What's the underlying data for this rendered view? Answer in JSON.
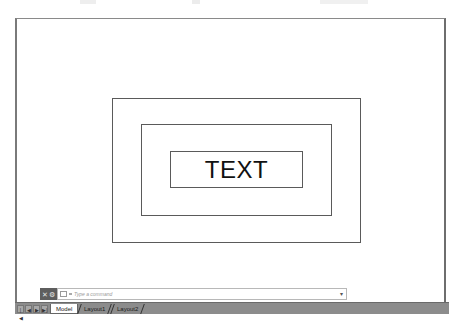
{
  "drawing": {
    "text_label": "TEXT",
    "rectangles": [
      {
        "name": "outer",
        "x": 110,
        "y": 97,
        "w": 249,
        "h": 145
      },
      {
        "name": "inner",
        "x": 139,
        "y": 123,
        "w": 191,
        "h": 92
      },
      {
        "name": "text-frame",
        "x": 168,
        "y": 150,
        "w": 133,
        "h": 37
      }
    ]
  },
  "command_line": {
    "close_icon": "✕",
    "customize_icon": "🔧",
    "placeholder": "Type a command",
    "dropdown_icon": "▾"
  },
  "tabs": {
    "nav": [
      "|◀",
      "◀",
      "▶",
      "▶|"
    ],
    "items": [
      {
        "label": "Model",
        "active": true
      },
      {
        "label": "Layout1",
        "active": false
      },
      {
        "label": "Layout2",
        "active": false
      }
    ]
  },
  "colors": {
    "viewport_bg": "#ffffff",
    "line": "#5a5a5a",
    "tabbar_bg": "#8c8c8c",
    "cmd_grip_bg": "#5e5e5e"
  }
}
